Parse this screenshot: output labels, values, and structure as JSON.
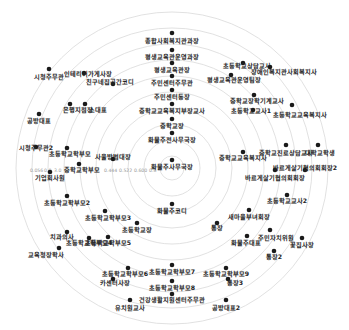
{
  "chart_data": {
    "type": "radial-network",
    "title": "",
    "center": {
      "x": 172,
      "y": 168
    },
    "rings": [
      12,
      28,
      44,
      60,
      76,
      92,
      108,
      124,
      140,
      156
    ],
    "axis_ticks": [
      "0.056",
      "0.0?3",
      "0.444",
      "0.522",
      "0.600",
      "0.6"
    ],
    "nodes": [
      {
        "label": "종합사회복지관과장",
        "x": 172,
        "y": 33,
        "lx": 172,
        "ly": 43
      },
      {
        "label": "평생교육관운영과장",
        "x": 172,
        "y": 50,
        "lx": 172,
        "ly": 59
      },
      {
        "label": "평생교육관장",
        "x": 172,
        "y": 63,
        "lx": 172,
        "ly": 72
      },
      {
        "label": "주민센터주무관",
        "x": 172,
        "y": 76,
        "lx": 172,
        "ly": 85
      },
      {
        "label": "주민센터동장",
        "x": 172,
        "y": 90,
        "lx": 172,
        "ly": 99
      },
      {
        "label": "중학교교육복지부장교사",
        "x": 172,
        "y": 104,
        "lx": 172,
        "ly": 113
      },
      {
        "label": "중학교장",
        "x": 172,
        "y": 119,
        "lx": 172,
        "ly": 128
      },
      {
        "label": "화물주전사무국장",
        "x": 172,
        "y": 133,
        "lx": 172,
        "ly": 142
      },
      {
        "label": "화물주사무국장",
        "x": 172,
        "y": 160,
        "lx": 172,
        "ly": 169
      },
      {
        "label": "화물주코디",
        "x": 172,
        "y": 204,
        "lx": 172,
        "ly": 213
      },
      {
        "label": "인테리어가게사장",
        "x": 84,
        "y": 73,
        "lx": 88,
        "ly": 76
      },
      {
        "label": "시청주무관",
        "x": 49,
        "y": 69,
        "lx": 49,
        "ly": 79
      },
      {
        "label": "친구네집공간코디",
        "x": 113,
        "y": 84,
        "lx": 110,
        "ly": 84
      },
      {
        "label": "은행지점장",
        "x": 70,
        "y": 104,
        "lx": 78,
        "ly": 112
      },
      {
        "label": "소대표",
        "x": 85,
        "y": 104,
        "lx": 98,
        "ly": 112
      },
      {
        "label": "공방대표",
        "x": 39,
        "y": 114,
        "lx": 39,
        "ly": 123
      },
      {
        "label": "초등학교상담교사",
        "x": 243,
        "y": 63,
        "lx": 247,
        "ly": 68
      },
      {
        "label": "장애인복지관사회복지사",
        "x": 270,
        "y": 67,
        "lx": 284,
        "ly": 74
      },
      {
        "label": "평생교육관운영팀장",
        "x": 231,
        "y": 75,
        "lx": 234,
        "ly": 82
      },
      {
        "label": "중학교장학기계교사",
        "x": 254,
        "y": 95,
        "lx": 257,
        "ly": 103
      },
      {
        "label": "초등학교교사1",
        "x": 253,
        "y": 110,
        "lx": 251,
        "ly": 113
      },
      {
        "label": "초등학교교육복지사",
        "x": 292,
        "y": 105,
        "lx": 300,
        "ly": 117
      },
      {
        "label": "중학교교육복지사",
        "x": 243,
        "y": 152,
        "lx": 243,
        "ly": 160
      },
      {
        "label": "중학교진로상담교사",
        "x": 286,
        "y": 145,
        "lx": 286,
        "ly": 155
      },
      {
        "label": "대학교학생",
        "x": 318,
        "y": 145,
        "lx": 320,
        "ly": 155
      },
      {
        "label": "바르게살기협의회회장",
        "x": 275,
        "y": 170,
        "lx": 275,
        "ly": 180
      },
      {
        "label": "바르게살기협의회회장2",
        "x": 305,
        "y": 170,
        "lx": 305,
        "ly": 170
      },
      {
        "label": "시청주무관2",
        "x": 36,
        "y": 147,
        "lx": 36,
        "ly": 150
      },
      {
        "label": "초등학교학부모",
        "x": 67,
        "y": 148,
        "lx": 70,
        "ly": 156
      },
      {
        "label": "사울방범대장",
        "x": 113,
        "y": 159,
        "lx": 113,
        "ly": 159
      },
      {
        "label": "중학교학부모",
        "x": 79,
        "y": 164,
        "lx": 82,
        "ly": 172
      },
      {
        "label": "기업회사원",
        "x": 50,
        "y": 172,
        "lx": 50,
        "ly": 180
      },
      {
        "label": "초등학교학부모2",
        "x": 67,
        "y": 196,
        "lx": 67,
        "ly": 205
      },
      {
        "label": "초등학교학부모3",
        "x": 105,
        "y": 211,
        "lx": 108,
        "ly": 220
      },
      {
        "label": "초등학교장",
        "x": 137,
        "y": 223,
        "lx": 137,
        "ly": 232
      },
      {
        "label": "치과의사",
        "x": 67,
        "y": 232,
        "lx": 62,
        "ly": 239
      },
      {
        "label": "초등학교학부모4",
        "x": 89,
        "y": 238,
        "lx": 89,
        "ly": 245
      },
      {
        "label": "초등학교학부모5",
        "x": 108,
        "y": 237,
        "lx": 108,
        "ly": 245
      },
      {
        "label": "교육청장학사",
        "x": 59,
        "y": 248,
        "lx": 46,
        "ly": 257
      },
      {
        "label": "초등학교교사2",
        "x": 287,
        "y": 195,
        "lx": 287,
        "ly": 203
      },
      {
        "label": "새마을부녀회장",
        "x": 249,
        "y": 210,
        "lx": 249,
        "ly": 219
      },
      {
        "label": "통장",
        "x": 217,
        "y": 223,
        "lx": 217,
        "ly": 230
      },
      {
        "label": "주민자치위원",
        "x": 270,
        "y": 230,
        "lx": 276,
        "ly": 240
      },
      {
        "label": "화물주대표",
        "x": 247,
        "y": 236,
        "lx": 246,
        "ly": 245
      },
      {
        "label": "꽃집사장",
        "x": 302,
        "y": 238,
        "lx": 302,
        "ly": 247
      },
      {
        "label": "통장2",
        "x": 274,
        "y": 251,
        "lx": 274,
        "ly": 259
      },
      {
        "label": "초등학교학부모6",
        "x": 128,
        "y": 268,
        "lx": 125,
        "ly": 276
      },
      {
        "label": "카센터사장",
        "x": 113,
        "y": 279,
        "lx": 115,
        "ly": 285
      },
      {
        "label": "초등학교학부모7",
        "x": 172,
        "y": 265,
        "lx": 172,
        "ly": 274
      },
      {
        "label": "초등학교학부모8",
        "x": 172,
        "y": 281,
        "lx": 172,
        "ly": 290
      },
      {
        "label": "초등학교학부모9",
        "x": 226,
        "y": 268,
        "lx": 226,
        "ly": 276
      },
      {
        "label": "통장3",
        "x": 228,
        "y": 279,
        "lx": 235,
        "ly": 285
      },
      {
        "label": "건강생활지원센터주무관",
        "x": 172,
        "y": 294,
        "lx": 172,
        "ly": 302
      },
      {
        "label": "유치원교사",
        "x": 130,
        "y": 300,
        "lx": 130,
        "ly": 310
      },
      {
        "label": "공방대표2",
        "x": 226,
        "y": 300,
        "lx": 226,
        "ly": 310
      }
    ]
  },
  "labels": {
    "nodes": [
      "종합사회복지관과장",
      "평생교육관운영과장",
      "평생교육관장",
      "주민센터주무관",
      "주민센터동장",
      "중학교교육복지부장교사",
      "중학교장",
      "화물주전사무국장",
      "화물주사무국장",
      "화물주코디",
      "인테리어가게사장",
      "시청주무관",
      "친구네집공간코디",
      "은행지점장",
      "소대표",
      "공방대표",
      "초등학교상담교사",
      "장애인복지관사회복지사",
      "평생교육관운영팀장",
      "중학교장학기계교사",
      "초등학교교사1",
      "초등학교교육복지사",
      "중학교교육복지사",
      "중학교진로상담교사",
      "대학교학생",
      "바르게살기협의회회장",
      "시청주무관",
      "초등학교학부모",
      "사울방범대장",
      "중학교학부모",
      "기업회사원",
      "초등학교학부모",
      "초등학교학부모",
      "초등학교장",
      "치과의사",
      "초등학교학부모",
      "초등학교학부모",
      "교육청장학사",
      "초등학교교사2",
      "새마을부녀회장",
      "통장",
      "주민자치위원",
      "화물주대표",
      "꽃집사장",
      "통장",
      "초등학교학부모",
      "카센터사장",
      "초등학교학부모",
      "초등학교학부모",
      "초등학교학부모",
      "통장",
      "건강생활지원센터주무관",
      "유치원교사",
      "공방대표"
    ]
  },
  "ticks": {
    "t0": "0.056",
    "t1": "0.0",
    "t2": "3.0",
    "t3": "0.444",
    "t4": "0.522",
    "t5": "0.600",
    "t6": "0.6"
  }
}
